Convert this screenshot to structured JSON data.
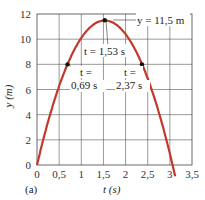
{
  "chart_data": {
    "type": "line",
    "title": "",
    "panel_label": "(a)",
    "xlabel": "t (s)",
    "ylabel": "y (m)",
    "xlim": [
      0,
      3.5
    ],
    "ylim": [
      0,
      12
    ],
    "grid": true,
    "x_ticks": [
      "0",
      "0,5",
      "1",
      "1,5",
      "2",
      "2,5",
      "3",
      "3,5"
    ],
    "y_ticks": [
      "0",
      "2",
      "4",
      "6",
      "8",
      "10",
      "12"
    ],
    "series": [
      {
        "name": "y(t)",
        "color": "#c0392b",
        "equation": "y = 15 t - 4.9 t^2",
        "x": [
          0,
          0.25,
          0.5,
          0.69,
          1.0,
          1.25,
          1.53,
          1.75,
          2.0,
          2.37,
          2.5,
          2.75,
          3.06,
          3.12
        ],
        "y": [
          0,
          3.44,
          6.28,
          8.02,
          10.1,
          11.09,
          11.5,
          11.24,
          10.4,
          8.02,
          6.88,
          4.19,
          0.0,
          -0.9
        ]
      }
    ],
    "points": [
      {
        "t": 0.69,
        "y": 8.0,
        "label_line1": "t =",
        "label_line2": "0,69 s"
      },
      {
        "t": 1.53,
        "y": 11.5,
        "label": "t = 1,53 s"
      },
      {
        "t": 2.37,
        "y": 8.0,
        "label_line1": "t =",
        "label_line2": "2,37 s"
      }
    ],
    "annotations": {
      "max_label": "y = 11,5 m",
      "peak_time": "t = 1,53 s",
      "t_eq": "t =",
      "t1": "0,69 s",
      "t2": "2,37 s"
    }
  }
}
